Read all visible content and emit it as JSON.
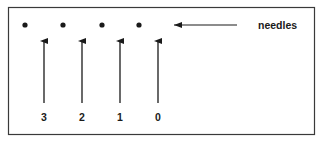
{
  "diagram": {
    "callout_label": "needles",
    "needles": [
      {
        "index": 0,
        "label": "3",
        "x": 44
      },
      {
        "index": 1,
        "label": "2",
        "x": 82
      },
      {
        "index": 2,
        "label": "1",
        "x": 120
      },
      {
        "index": 3,
        "label": "0",
        "x": 158
      }
    ],
    "dots": [
      {
        "x": 25
      },
      {
        "x": 63
      },
      {
        "x": 102
      },
      {
        "x": 139
      }
    ],
    "colors": {
      "ink": "#1a1a1a",
      "border": "#3a3a3a",
      "background": "#ffffff"
    }
  }
}
